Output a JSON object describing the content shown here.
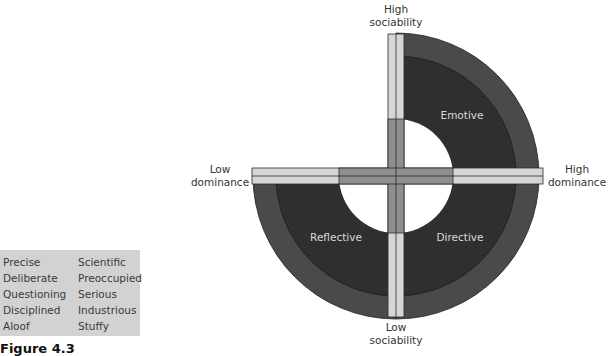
{
  "traits_box": {
    "column1": [
      "Precise",
      "Deliberate",
      "Questioning",
      "Disciplined",
      "Aloof"
    ],
    "column2": [
      "Scientific",
      "Preoccupied",
      "Serious",
      "Industrious",
      "Stuffy"
    ],
    "background": "#d2d2d2"
  },
  "caption": {
    "figure_number": "Figure 4.3",
    "title": ""
  },
  "diagram": {
    "axes": {
      "top": [
        "High",
        "sociability"
      ],
      "bottom": [
        "Low",
        "sociability"
      ],
      "left": [
        "Low",
        "dominance"
      ],
      "right": [
        "High",
        "dominance"
      ]
    },
    "quadrants": {
      "top_right": "Emotive",
      "bottom_left": "Reflective",
      "bottom_right": "Directive",
      "top_left": ""
    },
    "colors": {
      "outer_ring": "#4a4a4a",
      "inner_core": "#2f2f2f",
      "axis_bar_light": "#d6d6d6",
      "axis_bar_center": "#8e8e8e",
      "outline": "#1e1e1e"
    }
  }
}
